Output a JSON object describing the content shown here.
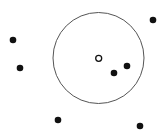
{
  "diagram": {
    "type": "radius-neighborhood",
    "stroke_color": "#555555",
    "point_color": "#111111",
    "background": "#ffffff",
    "search_circle": {
      "cx": 98.5,
      "cy": 58,
      "r": 45.5
    },
    "query_point": {
      "x": 98.7,
      "y": 58.3,
      "r": 3,
      "style": "hollow"
    },
    "points": [
      {
        "x": 13,
        "y": 40,
        "inside": false
      },
      {
        "x": 20,
        "y": 68,
        "inside": false
      },
      {
        "x": 153,
        "y": 20,
        "inside": false
      },
      {
        "x": 127,
        "y": 66,
        "inside": true
      },
      {
        "x": 114,
        "y": 73,
        "inside": true
      },
      {
        "x": 58,
        "y": 120,
        "inside": false
      },
      {
        "x": 140,
        "y": 126,
        "inside": false
      }
    ]
  }
}
